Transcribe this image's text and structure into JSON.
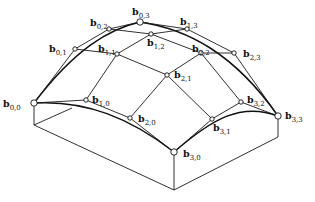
{
  "figure": {
    "points": [
      {
        "id": "b00",
        "label": "b",
        "sub": "0,0",
        "x": 34,
        "y": 103,
        "lx": 3,
        "ly": 107,
        "r": 3.2
      },
      {
        "id": "b01",
        "label": "b",
        "sub": "0,1",
        "x": 75,
        "y": 49,
        "lx": 49,
        "ly": 52,
        "r": 2.2
      },
      {
        "id": "b02",
        "label": "b",
        "sub": "0,2",
        "x": 109,
        "y": 29,
        "lx": 90,
        "ly": 26,
        "r": 2.2
      },
      {
        "id": "b03",
        "label": "b",
        "sub": "0,3",
        "x": 140,
        "y": 22,
        "lx": 132,
        "ly": 15,
        "r": 3.2
      },
      {
        "id": "b10",
        "label": "b",
        "sub": "1,0",
        "x": 86,
        "y": 100,
        "lx": 92,
        "ly": 103,
        "r": 2.2
      },
      {
        "id": "b11",
        "label": "b",
        "sub": "1,1",
        "x": 117,
        "y": 54,
        "lx": 98,
        "ly": 52,
        "r": 2.2
      },
      {
        "id": "b12",
        "label": "b",
        "sub": "1,2",
        "x": 151,
        "y": 34,
        "lx": 147,
        "ly": 46,
        "r": 2.2
      },
      {
        "id": "b13",
        "label": "b",
        "sub": "1,3",
        "x": 187,
        "y": 29,
        "lx": 180,
        "ly": 25,
        "r": 2.2
      },
      {
        "id": "b20",
        "label": "b",
        "sub": "2,0",
        "x": 130,
        "y": 118,
        "lx": 138,
        "ly": 122,
        "r": 2.2
      },
      {
        "id": "b21",
        "label": "b",
        "sub": "2,1",
        "x": 167,
        "y": 75,
        "lx": 174,
        "ly": 78,
        "r": 2.2
      },
      {
        "id": "b22",
        "label": "b",
        "sub": "2,2",
        "x": 201,
        "y": 53,
        "lx": 192,
        "ly": 52,
        "r": 2.2
      },
      {
        "id": "b23",
        "label": "b",
        "sub": "2,3",
        "x": 234,
        "y": 53,
        "lx": 243,
        "ly": 57,
        "r": 2.2
      },
      {
        "id": "b30",
        "label": "b",
        "sub": "3,0",
        "x": 174,
        "y": 152,
        "lx": 183,
        "ly": 157,
        "r": 3.2
      },
      {
        "id": "b31",
        "label": "b",
        "sub": "3,1",
        "x": 212,
        "y": 119,
        "lx": 213,
        "ly": 131,
        "r": 2.2
      },
      {
        "id": "b32",
        "label": "b",
        "sub": "3,2",
        "x": 241,
        "y": 102,
        "lx": 247,
        "ly": 103,
        "r": 2.2
      },
      {
        "id": "b33",
        "label": "b",
        "sub": "3,3",
        "x": 278,
        "y": 116,
        "lx": 285,
        "ly": 119,
        "r": 3.2
      }
    ],
    "box": {
      "front_bottom": {
        "x": 174,
        "y": 190
      },
      "left_bottom": {
        "x": 34,
        "y": 125
      },
      "right_bottom": {
        "x": 278,
        "y": 137
      }
    }
  }
}
